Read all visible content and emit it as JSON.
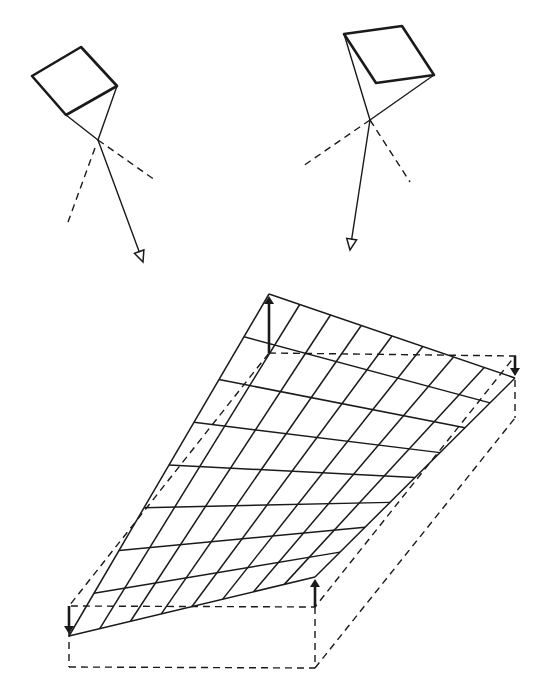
{
  "figure": {
    "colors": {
      "ink": "#1a1a1a",
      "background": "#ffffff"
    },
    "facet_left": {
      "square": [
        [
          32,
          76
        ],
        [
          81,
          47
        ],
        [
          117,
          86
        ],
        [
          66,
          115
        ]
      ],
      "apex": [
        98,
        140
      ],
      "dashed_lines": [
        [
          [
            98,
            140
          ],
          [
            155,
            180
          ]
        ],
        [
          [
            95,
            148
          ],
          [
            68,
            222
          ]
        ]
      ],
      "ray": {
        "from": [
          98,
          140
        ],
        "to": [
          143,
          262
        ]
      }
    },
    "facet_right": {
      "square": [
        [
          344,
          34
        ],
        [
          402,
          26
        ],
        [
          434,
          75
        ],
        [
          376,
          83
        ]
      ],
      "apex": [
        370,
        120
      ],
      "dashed_lines": [
        [
          [
            370,
            120
          ],
          [
            303,
            166
          ]
        ],
        [
          [
            370,
            120
          ],
          [
            410,
            182
          ]
        ]
      ],
      "ray": {
        "from": [
          370,
          120
        ],
        "to": [
          350,
          250
        ]
      }
    },
    "surface": {
      "corners": {
        "top_left": [
          269,
          294
        ],
        "top_right": [
          515,
          378
        ],
        "bottom_right": [
          315,
          577
        ],
        "bottom_left": [
          69,
          636
        ]
      },
      "grid_divisions_u": 8,
      "grid_divisions_v": 8
    },
    "reference_plane": {
      "corners": {
        "top_left": [
          269,
          353
        ],
        "top_right": [
          515,
          356
        ],
        "bottom_right": [
          315,
          607
        ],
        "bottom_left": [
          69,
          606
        ]
      }
    },
    "box": {
      "bottom_left": [
        69,
        667
      ],
      "bottom_right": [
        315,
        668
      ],
      "back_right_bottom": [
        515,
        418
      ]
    },
    "displacement_arrows": [
      {
        "name": "top-left-up",
        "from": [
          269,
          353
        ],
        "to": [
          269,
          296
        ]
      },
      {
        "name": "top-right-down",
        "from": [
          515,
          356
        ],
        "to": [
          515,
          376
        ]
      },
      {
        "name": "bottom-right-up",
        "from": [
          315,
          607
        ],
        "to": [
          315,
          579
        ]
      },
      {
        "name": "bottom-left-down",
        "from": [
          69,
          606
        ],
        "to": [
          69,
          634
        ]
      }
    ]
  }
}
